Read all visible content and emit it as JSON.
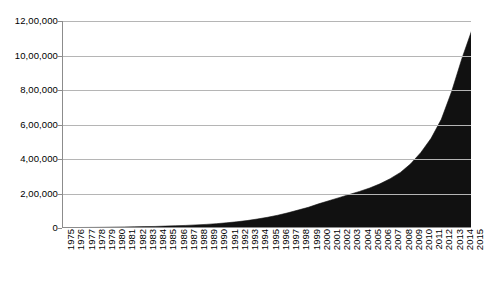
{
  "chart_data": {
    "type": "area",
    "title": "",
    "subtitle": "",
    "xlabel": "",
    "ylabel": "",
    "legend": [],
    "legend_position": "none",
    "grid": "horizontal",
    "series_color": "#111111",
    "gridline_color": "#b5b5b5",
    "axis_color": "#8c8c8c",
    "background_color": "#ffffff",
    "xlim": [
      1975,
      2015
    ],
    "ylim": [
      0,
      1200000
    ],
    "y_tick_step": 200000,
    "y_tick_labels": [
      "12,00,000",
      "10,00,000",
      "8,00,000",
      "6,00,000",
      "4,00,000",
      "2,00,000",
      "0"
    ],
    "y_tick_values": [
      1200000,
      1000000,
      800000,
      600000,
      400000,
      200000,
      0
    ],
    "categories": [
      "1975",
      "1976",
      "1977",
      "1978",
      "1979",
      "1980",
      "1981",
      "1982",
      "1983",
      "1984",
      "1985",
      "1986",
      "1987",
      "1988",
      "1989",
      "1990",
      "1991",
      "1992",
      "1993",
      "1994",
      "1995",
      "1996",
      "1997",
      "1998",
      "1999",
      "2000",
      "2001",
      "2002",
      "2003",
      "2004",
      "2005",
      "2006",
      "2007",
      "2008",
      "2009",
      "2010",
      "2011",
      "2012",
      "2013",
      "2014",
      "2015"
    ],
    "values": [
      2000,
      2500,
      3000,
      3500,
      4000,
      5000,
      6000,
      7000,
      8000,
      9000,
      11000,
      13000,
      15000,
      18000,
      21000,
      25000,
      30000,
      36000,
      43000,
      52000,
      62000,
      74000,
      88000,
      104000,
      120000,
      140000,
      158000,
      176000,
      194000,
      212000,
      232000,
      256000,
      286000,
      322000,
      372000,
      438000,
      520000,
      630000,
      790000,
      980000,
      1150000
    ]
  }
}
